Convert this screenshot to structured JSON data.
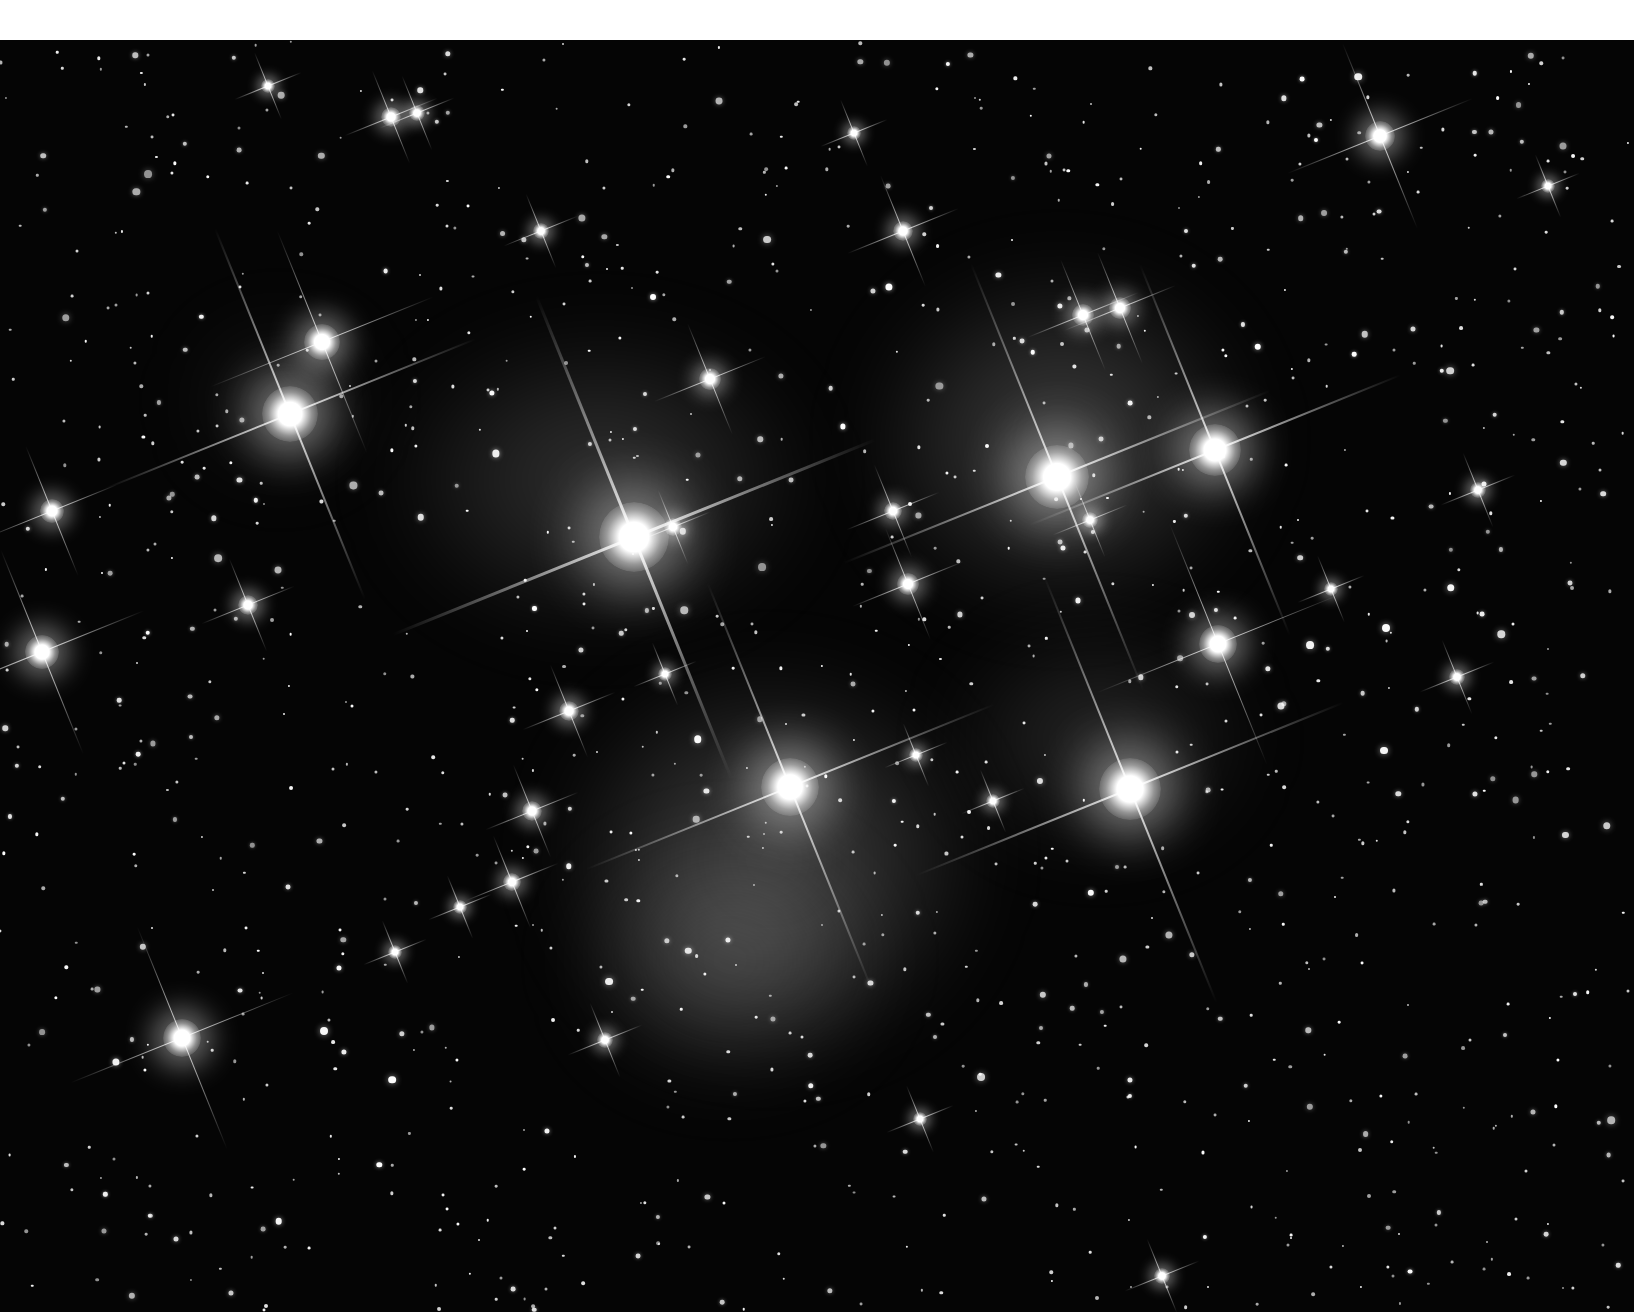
{
  "image": {
    "subject": "Pleiades star cluster with blue reflection nebulosity (grayscale)",
    "width": 1634,
    "height": 1312,
    "top_band_height": 40,
    "background_color": "#050505",
    "top_band_color": "#ffffff"
  },
  "nebulae": [
    {
      "x": 600,
      "y": 480,
      "w": 420,
      "h": 300,
      "opacity": 0.22
    },
    {
      "x": 1060,
      "y": 440,
      "w": 380,
      "h": 340,
      "opacity": 0.28
    },
    {
      "x": 770,
      "y": 860,
      "w": 420,
      "h": 380,
      "opacity": 0.3
    },
    {
      "x": 730,
      "y": 960,
      "w": 300,
      "h": 240,
      "opacity": 0.25
    },
    {
      "x": 1100,
      "y": 740,
      "w": 300,
      "h": 220,
      "opacity": 0.18
    },
    {
      "x": 280,
      "y": 400,
      "w": 180,
      "h": 160,
      "opacity": 0.12
    }
  ],
  "bright_stars": [
    {
      "x": 634,
      "y": 537,
      "core": 70,
      "spike": 260,
      "angle": -22
    },
    {
      "x": 1057,
      "y": 477,
      "core": 64,
      "spike": 230,
      "angle": -22
    },
    {
      "x": 1215,
      "y": 450,
      "core": 52,
      "spike": 200,
      "angle": -22
    },
    {
      "x": 790,
      "y": 787,
      "core": 58,
      "spike": 220,
      "angle": -22
    },
    {
      "x": 1130,
      "y": 789,
      "core": 62,
      "spike": 230,
      "angle": -22
    },
    {
      "x": 290,
      "y": 414,
      "core": 56,
      "spike": 200,
      "angle": -22
    },
    {
      "x": 322,
      "y": 342,
      "core": 36,
      "spike": 120,
      "angle": -22
    },
    {
      "x": 1218,
      "y": 644,
      "core": 38,
      "spike": 130,
      "angle": -22
    },
    {
      "x": 182,
      "y": 1038,
      "core": 38,
      "spike": 120,
      "angle": -22
    },
    {
      "x": 42,
      "y": 652,
      "core": 34,
      "spike": 110,
      "angle": -22
    },
    {
      "x": 1380,
      "y": 136,
      "core": 30,
      "spike": 100,
      "angle": -22
    },
    {
      "x": 52,
      "y": 511,
      "core": 24,
      "spike": 70,
      "angle": -22
    },
    {
      "x": 710,
      "y": 379,
      "core": 22,
      "spike": 60,
      "angle": -22
    },
    {
      "x": 903,
      "y": 231,
      "core": 20,
      "spike": 60,
      "angle": -22
    },
    {
      "x": 1083,
      "y": 315,
      "core": 22,
      "spike": 60,
      "angle": -22
    },
    {
      "x": 1120,
      "y": 308,
      "core": 22,
      "spike": 60,
      "angle": -22
    },
    {
      "x": 908,
      "y": 584,
      "core": 22,
      "spike": 60,
      "angle": -22
    },
    {
      "x": 893,
      "y": 511,
      "core": 18,
      "spike": 50,
      "angle": -22
    },
    {
      "x": 569,
      "y": 711,
      "core": 20,
      "spike": 50,
      "angle": -22
    },
    {
      "x": 532,
      "y": 811,
      "core": 20,
      "spike": 50,
      "angle": -22
    },
    {
      "x": 512,
      "y": 882,
      "core": 18,
      "spike": 50,
      "angle": -22
    },
    {
      "x": 248,
      "y": 605,
      "core": 20,
      "spike": 50,
      "angle": -22
    },
    {
      "x": 391,
      "y": 117,
      "core": 20,
      "spike": 50,
      "angle": -22
    },
    {
      "x": 417,
      "y": 113,
      "core": 16,
      "spike": 40,
      "angle": -22
    },
    {
      "x": 541,
      "y": 231,
      "core": 16,
      "spike": 40,
      "angle": -22
    },
    {
      "x": 854,
      "y": 133,
      "core": 14,
      "spike": 36,
      "angle": -22
    },
    {
      "x": 268,
      "y": 86,
      "core": 14,
      "spike": 36,
      "angle": -22
    },
    {
      "x": 1478,
      "y": 490,
      "core": 16,
      "spike": 40,
      "angle": -22
    },
    {
      "x": 1457,
      "y": 677,
      "core": 16,
      "spike": 40,
      "angle": -22
    },
    {
      "x": 605,
      "y": 1040,
      "core": 16,
      "spike": 40,
      "angle": -22
    },
    {
      "x": 920,
      "y": 1119,
      "core": 14,
      "spike": 36,
      "angle": -22
    },
    {
      "x": 1331,
      "y": 589,
      "core": 14,
      "spike": 36,
      "angle": -22
    },
    {
      "x": 1548,
      "y": 186,
      "core": 14,
      "spike": 34,
      "angle": -22
    },
    {
      "x": 1162,
      "y": 1276,
      "core": 16,
      "spike": 40,
      "angle": -22
    },
    {
      "x": 1090,
      "y": 520,
      "core": 16,
      "spike": 40,
      "angle": -22
    },
    {
      "x": 673,
      "y": 527,
      "core": 18,
      "spike": 40,
      "angle": -22
    },
    {
      "x": 916,
      "y": 755,
      "core": 14,
      "spike": 34,
      "angle": -22
    },
    {
      "x": 993,
      "y": 801,
      "core": 14,
      "spike": 34,
      "angle": -22
    },
    {
      "x": 395,
      "y": 952,
      "core": 14,
      "spike": 34,
      "angle": -22
    },
    {
      "x": 460,
      "y": 907,
      "core": 14,
      "spike": 34,
      "angle": -22
    },
    {
      "x": 665,
      "y": 674,
      "core": 14,
      "spike": 34,
      "angle": -22
    }
  ],
  "faint_star_seed": 45,
  "faint_star_count": 1100
}
